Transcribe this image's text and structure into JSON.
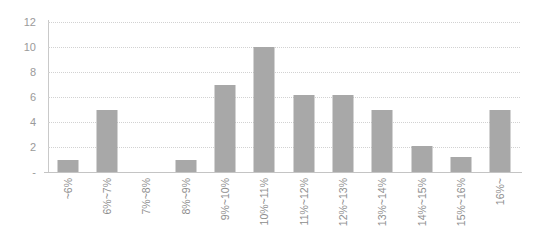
{
  "chart_data": {
    "type": "bar",
    "title": "",
    "subtitle": "",
    "xlabel": "",
    "ylabel": "",
    "legend": [],
    "legend_position": "none",
    "grid": true,
    "grid_axis": "y",
    "ylim": [
      0,
      12
    ],
    "ytick_step": 2,
    "ytick_labels": [
      "12",
      "10",
      "8",
      "6",
      "4",
      "2",
      "-"
    ],
    "ytick_values": [
      12,
      10,
      8,
      6,
      4,
      2,
      0
    ],
    "categories": [
      "~6%",
      "6%~7%",
      "7%~8%",
      "8%~9%",
      "9%~10%",
      "10%~11%",
      "11%~12%",
      "12%~13%",
      "13%~14%",
      "14%~15%",
      "15%~16%",
      "16%~"
    ],
    "values": [
      1,
      5,
      0,
      1,
      7,
      10,
      6.2,
      6.2,
      5,
      2.1,
      1.2,
      5
    ],
    "annotations": []
  },
  "style": {
    "bar_color": "#a8a8a8",
    "gridline_color": "#d2d2d2",
    "axis_color": "#c4c4c4",
    "label_color": "#8e8e8e",
    "background_color": "#ffffff"
  }
}
